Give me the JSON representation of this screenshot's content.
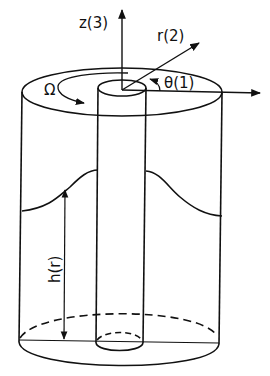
{
  "diagram": {
    "labels": {
      "z_axis": "z(3)",
      "r_axis": "r(2)",
      "theta_axis": "θ(1)",
      "rotation": "Ω",
      "height": "h(r)"
    },
    "colors": {
      "stroke": "#111111",
      "background": "#ffffff"
    }
  }
}
